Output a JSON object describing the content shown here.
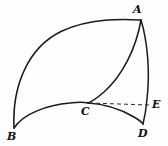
{
  "figure": {
    "background_color": "#fefefe",
    "stroke_color": "#1a1a1a",
    "dash_color": "#2a2a2a",
    "width": 168,
    "height": 146,
    "labels": [
      {
        "text": "A",
        "x": 133,
        "y": 4
      },
      {
        "text": "B",
        "x": 7,
        "y": 131
      },
      {
        "text": "C",
        "x": 81,
        "y": 106
      },
      {
        "text": "D",
        "x": 138,
        "y": 128
      },
      {
        "text": "E",
        "x": 152,
        "y": 99
      }
    ],
    "points": {
      "A": {
        "x": 141,
        "y": 20
      },
      "B": {
        "x": 14,
        "y": 128
      },
      "C": {
        "x": 88,
        "y": 103
      },
      "D": {
        "x": 143,
        "y": 124
      },
      "E": {
        "x": 149,
        "y": 105
      }
    },
    "edges": [
      {
        "name": "arc-B-to-A",
        "style": "solid",
        "width": 1.6
      },
      {
        "name": "arc-B-to-C",
        "style": "solid",
        "width": 1.6
      },
      {
        "name": "arc-C-to-D",
        "style": "solid",
        "width": 1.6
      },
      {
        "name": "curve-A-to-C",
        "style": "solid",
        "width": 1.5
      },
      {
        "name": "curve-A-to-D",
        "style": "solid",
        "width": 1.5
      },
      {
        "name": "segment-C-to-E",
        "style": "dashed",
        "width": 1.0
      }
    ]
  }
}
